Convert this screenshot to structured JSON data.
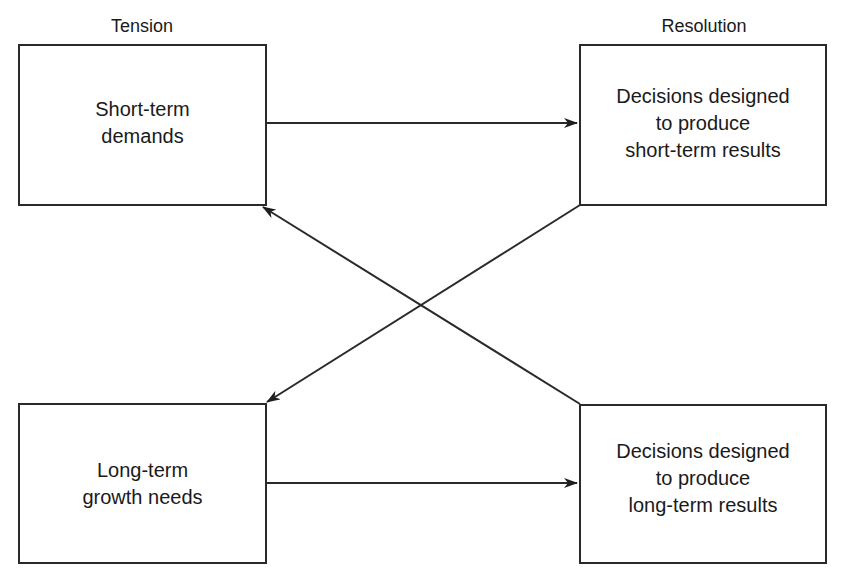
{
  "diagram": {
    "columns": {
      "left_heading": "Tension",
      "right_heading": "Resolution"
    },
    "nodes": [
      {
        "id": "short-term-demands",
        "lines": [
          "Short-term",
          "demands"
        ]
      },
      {
        "id": "short-term-decisions",
        "lines": [
          "Decisions designed",
          "to produce",
          "short-term results"
        ]
      },
      {
        "id": "long-term-needs",
        "lines": [
          "Long-term",
          "growth needs"
        ]
      },
      {
        "id": "long-term-decisions",
        "lines": [
          "Decisions designed",
          "to produce",
          "long-term results"
        ]
      }
    ],
    "edges": [
      {
        "from": "short-term-demands",
        "to": "short-term-decisions",
        "style": "horizontal-arrow"
      },
      {
        "from": "long-term-needs",
        "to": "long-term-decisions",
        "style": "horizontal-arrow"
      },
      {
        "from": "short-term-decisions",
        "to": "long-term-needs",
        "style": "diagonal-arrow"
      },
      {
        "from": "long-term-decisions",
        "to": "short-term-demands",
        "style": "diagonal-arrow"
      }
    ],
    "colors": {
      "stroke": "#2a2a2a",
      "background": "#ffffff",
      "text": "#1a1a1a"
    }
  }
}
